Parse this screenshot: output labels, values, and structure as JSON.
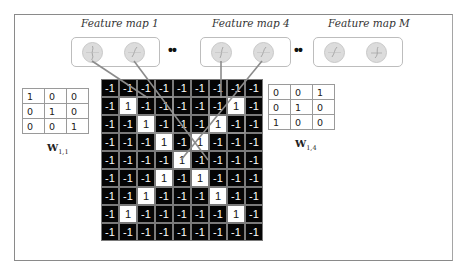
{
  "feature_maps": [
    {
      "title": "Feature map 1",
      "neurons": 2
    },
    {
      "title": "Feature map 4",
      "neurons": 2
    },
    {
      "title": "Feature map M",
      "neurons": 2
    }
  ],
  "ellipsis": "••",
  "input_grid": {
    "rows": [
      [
        "-1",
        "-1",
        "-1",
        "-1",
        "-1",
        "-1",
        "-1",
        "-1",
        "-1"
      ],
      [
        "-1",
        "1",
        "-1",
        "-1",
        "-1",
        "-1",
        "-1",
        "1",
        "-1"
      ],
      [
        "-1",
        "-1",
        "1",
        "-1",
        "-1",
        "-1",
        "1",
        "-1",
        "-1"
      ],
      [
        "-1",
        "-1",
        "-1",
        "1",
        "-1",
        "1",
        "-1",
        "-1",
        "-1"
      ],
      [
        "-1",
        "-1",
        "-1",
        "-1",
        "1",
        "-1",
        "-1",
        "-1",
        "-1"
      ],
      [
        "-1",
        "-1",
        "-1",
        "1",
        "-1",
        "1",
        "-1",
        "-1",
        "-1"
      ],
      [
        "-1",
        "-1",
        "1",
        "-1",
        "-1",
        "-1",
        "1",
        "-1",
        "-1"
      ],
      [
        "-1",
        "1",
        "-1",
        "-1",
        "-1",
        "-1",
        "-1",
        "1",
        "-1"
      ],
      [
        "-1",
        "-1",
        "-1",
        "-1",
        "-1",
        "-1",
        "-1",
        "-1",
        "-1"
      ]
    ]
  },
  "kernels": [
    {
      "label": "W",
      "subscript": "1,1",
      "values": [
        [
          "1",
          "0",
          "0"
        ],
        [
          "0",
          "1",
          "0"
        ],
        [
          "0",
          "0",
          "1"
        ]
      ]
    },
    {
      "label": "W",
      "subscript": "1,4",
      "values": [
        [
          "0",
          "0",
          "1"
        ],
        [
          "0",
          "1",
          "0"
        ],
        [
          "1",
          "0",
          "0"
        ]
      ]
    }
  ],
  "colors": {
    "cell_negative": "#050505",
    "cell_positive": "#ffffff",
    "connection_line": "#8c8c8c",
    "neuron_fill": "#dcdcdc"
  }
}
